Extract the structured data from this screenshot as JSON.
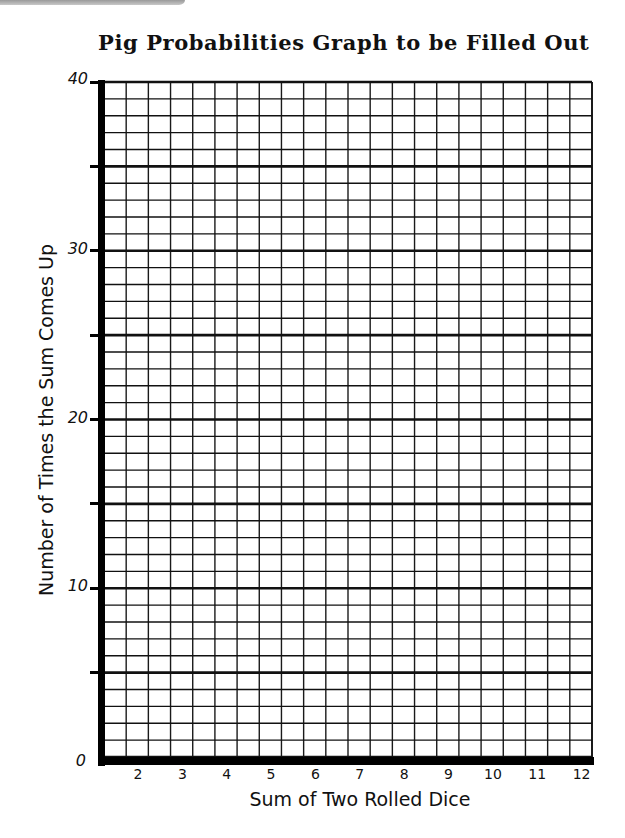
{
  "chart_data": {
    "type": "bar",
    "title": "Pig Probabilities Graph to be Filled Out",
    "xlabel": "Sum of Two Rolled Dice",
    "ylabel": "Number of Times the Sum Comes Up",
    "categories": [
      "2",
      "3",
      "4",
      "5",
      "6",
      "7",
      "8",
      "9",
      "10",
      "11",
      "12"
    ],
    "values": [
      null,
      null,
      null,
      null,
      null,
      null,
      null,
      null,
      null,
      null,
      null
    ],
    "ylim": [
      0,
      40
    ],
    "y_tick_labels": [
      "0",
      "10",
      "20",
      "30",
      "40"
    ],
    "y_major_ticks": [
      0,
      5,
      10,
      15,
      20,
      25,
      30,
      35,
      40
    ],
    "y_minor_step": 1,
    "grid": true,
    "grid_columns": 22,
    "grid_rows": 40,
    "legend": null,
    "note": "Blank worksheet grid; no data plotted"
  },
  "colors": {
    "background": "#ffffff",
    "ink": "#000000",
    "corner_shade": "#9a9a9a"
  }
}
